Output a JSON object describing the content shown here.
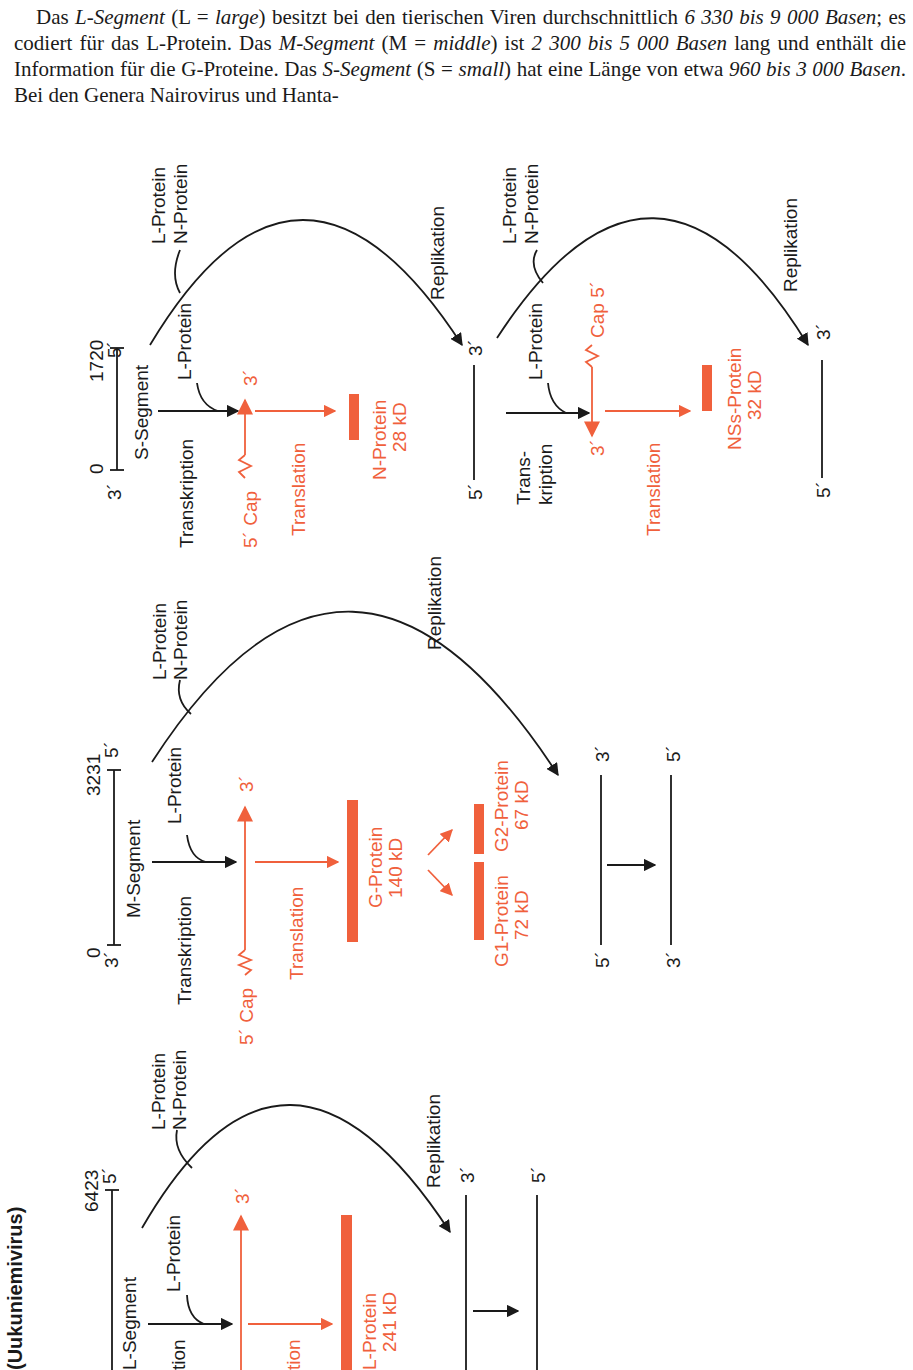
{
  "paragraph": {
    "s1": "Das ",
    "l_segment": "L-Segment",
    "s2": " (L = ",
    "large": "large",
    "s3": ") besitzt bei den tierischen Viren durchschnittlich ",
    "l_range": "6 330 bis 9 000 Basen",
    "s4": "; es codiert für das L-Protein. Das ",
    "m_segment": "M-Segment",
    "s5": " (M = ",
    "middle": "middle",
    "s6": ") ist ",
    "m_range": "2 300 bis 5 000 Basen",
    "s7": " lang und enthält die Information für die G-Proteine. Das ",
    "s_segment": "S-Segment",
    "s8": " (S = ",
    "small": "small",
    "s9": ") hat eine Länge von etwa ",
    "s_range": "960 bis 3 000 Basen",
    "s10": ". Bei den Genera Nairovirus und Hanta-"
  },
  "colors": {
    "text": "#1a1a1a",
    "accent": "#f0603c"
  },
  "figure": {
    "orientation": "rotated-90-ccw",
    "genus_label": "(Uukuniemivirus)",
    "s_segment": {
      "name": "S-Segment",
      "start": "0",
      "end": "1720",
      "three_prime": "3´",
      "five_prime": "5´",
      "polymerase": "L-Protein",
      "replication_proteins": [
        "L-Protein",
        "N-Protein"
      ],
      "replication": "Replikation",
      "transcription": "Transkription",
      "cap": "5´ Cap",
      "mrna_end": "3´",
      "translation": "Translation",
      "protein": "N-Protein",
      "protein_size": "28 kD",
      "copy_3": "3´",
      "copy_5": "5´"
    },
    "s_segment_ambisense": {
      "polymerase": "L-Protein",
      "replication_proteins": [
        "L-Protein",
        "N-Protein"
      ],
      "replication": "Replikation",
      "transcription_1": "Trans-",
      "transcription_2": "kription",
      "cap": "Cap 5´",
      "mrna_end": "3´",
      "translation": "Translation",
      "protein": "NSs-Protein",
      "protein_size": "32 kD",
      "copy_3": "3´",
      "copy_5": "5´"
    },
    "m_segment": {
      "name": "M-Segment",
      "start": "0",
      "end": "3231",
      "three_prime": "3´",
      "five_prime": "5´",
      "polymerase": "L-Protein",
      "replication_proteins": [
        "L-Protein",
        "N-Protein"
      ],
      "replication": "Replikation",
      "transcription": "Transkription",
      "cap": "5´ Cap",
      "mrna_end": "3´",
      "translation": "Translation",
      "precursor": "G-Protein",
      "precursor_size": "140 kD",
      "g1": "G1-Protein",
      "g1_size": "72 kD",
      "g2": "G2-Protein",
      "g2_size": "67 kD",
      "copy_a_3": "3´",
      "copy_a_5": "5´",
      "copy_b_5": "5´",
      "copy_b_3": "3´"
    },
    "l_segment": {
      "name": "L-Segment",
      "end": "6423",
      "five_prime": "5´",
      "polymerase": "L-Protein",
      "replication_proteins": [
        "L-Protein",
        "N-Protein"
      ],
      "replication": "Replikation",
      "transcription_partial": "tion",
      "mrna_end": "3´",
      "translation_partial": "tion",
      "protein": "L-Protein",
      "protein_size": "241 kD",
      "copy_a_3": "3´",
      "copy_b_5": "5´"
    }
  }
}
